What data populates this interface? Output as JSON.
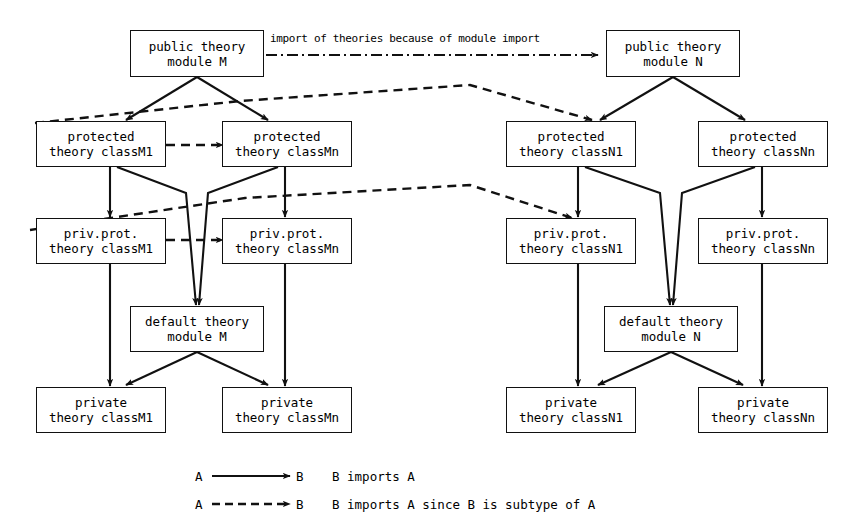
{
  "diagram": {
    "nodes": [
      {
        "id": "pubM",
        "l1": "public theory",
        "l2": "module M"
      },
      {
        "id": "pubN",
        "l1": "public theory",
        "l2": "module N"
      },
      {
        "id": "protM1",
        "l1": "protected",
        "l2": "theory classM1"
      },
      {
        "id": "protMn",
        "l1": "protected",
        "l2": "theory classMn"
      },
      {
        "id": "protN1",
        "l1": "protected",
        "l2": "theory classN1"
      },
      {
        "id": "protNn",
        "l1": "protected",
        "l2": "theory classNn"
      },
      {
        "id": "ppM1",
        "l1": "priv.prot.",
        "l2": "theory classM1"
      },
      {
        "id": "ppMn",
        "l1": "priv.prot.",
        "l2": "theory classMn"
      },
      {
        "id": "ppN1",
        "l1": "priv.prot.",
        "l2": "theory classN1"
      },
      {
        "id": "ppNn",
        "l1": "priv.prot.",
        "l2": "theory classNn"
      },
      {
        "id": "defM",
        "l1": "default theory",
        "l2": "module M"
      },
      {
        "id": "defN",
        "l1": "default theory",
        "l2": "module N"
      },
      {
        "id": "privM1",
        "l1": "private",
        "l2": "theory classM1"
      },
      {
        "id": "privMn",
        "l1": "private",
        "l2": "theory classMn"
      },
      {
        "id": "privN1",
        "l1": "private",
        "l2": "theory classN1"
      },
      {
        "id": "privNn",
        "l1": "private",
        "l2": "theory classNn"
      }
    ],
    "edge_label_top": "import of theories because of module import",
    "legend": {
      "row1_symbol_a": "A",
      "row1_symbol_b": "B",
      "row1_text": "B imports A",
      "row2_symbol_a": "A",
      "row2_symbol_b": "B",
      "row2_text": "B imports A since B is subtype of A"
    },
    "colors": {
      "stroke": "#111111",
      "background": "#ffffff"
    }
  }
}
